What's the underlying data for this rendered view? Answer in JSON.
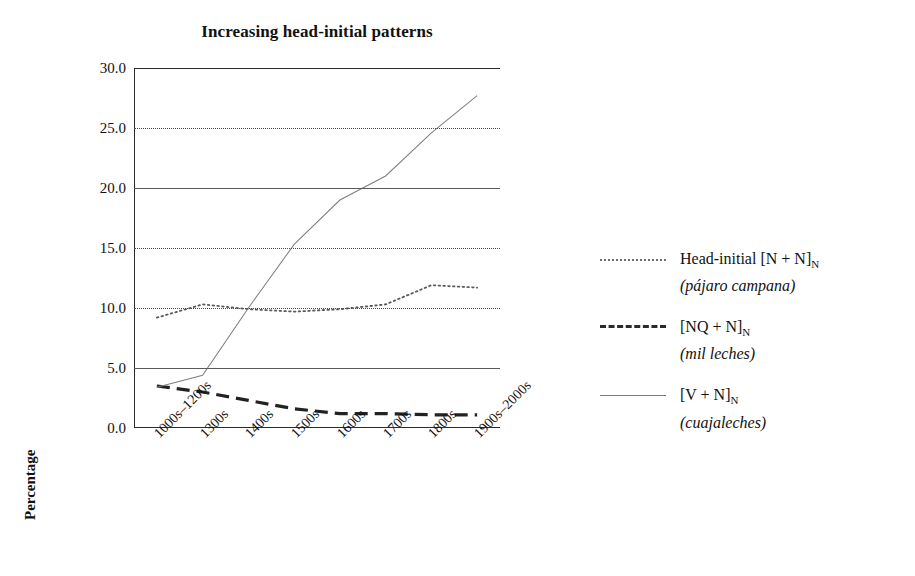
{
  "chart_data": {
    "type": "line",
    "title": "Increasing head-initial patterns",
    "xlabel": "",
    "ylabel": "Percentage",
    "ylim": [
      0.0,
      30.0
    ],
    "ytick_labels": [
      "30.0",
      "25.0",
      "20.0",
      "15.0",
      "10.0",
      "5.0",
      "0.0"
    ],
    "ytick_values": [
      30.0,
      25.0,
      20.0,
      15.0,
      10.0,
      5.0,
      0.0
    ],
    "grid": "horizontal",
    "gridline_styles": {
      "30.0": "none",
      "25.0": "dotted",
      "20.0": "solid",
      "15.0": "dotted",
      "10.0": "dotted",
      "5.0": "solid",
      "0.0": "axis"
    },
    "legend_position": "right",
    "categories": [
      "1000s–1200s",
      "1300s",
      "1400s",
      "1500s",
      "1600s",
      "1700s",
      "1800s",
      "1900s–2000s"
    ],
    "series": [
      {
        "name": "Head-initial [N + N]N (pájaro campana)",
        "style": "dotted",
        "color": "#5a5a5a",
        "values": [
          9.2,
          10.3,
          9.9,
          9.7,
          9.9,
          10.3,
          11.9,
          11.7
        ]
      },
      {
        "name": "[NQ + N]N (mil leches)",
        "style": "dashed",
        "color": "#222222",
        "values": [
          3.5,
          3.0,
          2.3,
          1.6,
          1.2,
          1.2,
          1.1,
          1.1
        ]
      },
      {
        "name": "[V + N]N (cuajaleches)",
        "style": "solid-thin",
        "color": "#808080",
        "values": [
          3.4,
          4.4,
          10.0,
          15.3,
          19.0,
          21.0,
          24.6,
          27.7
        ]
      }
    ]
  },
  "legend": {
    "items": [
      {
        "sample": "dotted-line-sample",
        "line1_pre": "Head-initial [N + N]",
        "line1_sub": "N",
        "line2": "(pájaro campana)"
      },
      {
        "sample": "dashed-line-sample",
        "line1_pre": "[NQ + N]",
        "line1_sub": "N",
        "line2": "(mil leches)"
      },
      {
        "sample": "thin-line-sample",
        "line1_pre": "[V + N]",
        "line1_sub": "N",
        "line2": "(cuajaleches)"
      }
    ]
  }
}
